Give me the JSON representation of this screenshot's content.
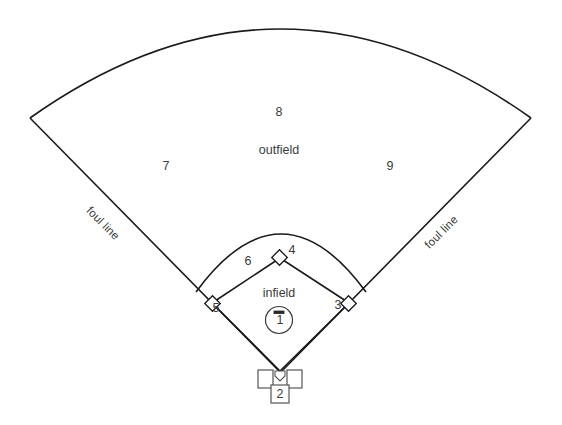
{
  "diagram": {
    "background_color": "#ffffff",
    "line_color": "#1b1b1b",
    "text_color": "#3b3b3b"
  },
  "regions": {
    "outfield_label": "outfield",
    "infield_label": "infield"
  },
  "foul_lines": {
    "left_label": "foul line",
    "right_label": "foul line"
  },
  "positions": [
    {
      "number": "1",
      "name": "pitcher",
      "x": 280,
      "y": 320
    },
    {
      "number": "2",
      "name": "catcher",
      "x": 280,
      "y": 392
    },
    {
      "number": "3",
      "name": "first-base",
      "x": 338,
      "y": 305
    },
    {
      "number": "4",
      "name": "second-base",
      "x": 292,
      "y": 250
    },
    {
      "number": "5",
      "name": "third-base",
      "x": 216,
      "y": 308
    },
    {
      "number": "6",
      "name": "shortstop",
      "x": 248,
      "y": 261
    },
    {
      "number": "7",
      "name": "left-field",
      "x": 166,
      "y": 166
    },
    {
      "number": "8",
      "name": "center-field",
      "x": 279,
      "y": 112
    },
    {
      "number": "9",
      "name": "right-field",
      "x": 390,
      "y": 166
    }
  ],
  "base_markers": {
    "second_base": "second-base-marker",
    "first_base": "first-base-marker",
    "third_base": "third-base-marker",
    "home_plate": "home-plate-marker",
    "pitchers_rubber": "pitchers-rubber-marker"
  },
  "boxes": {
    "left_batters_box": "left-batters-box",
    "right_batters_box": "right-batters-box",
    "catchers_box": "catchers-box"
  }
}
